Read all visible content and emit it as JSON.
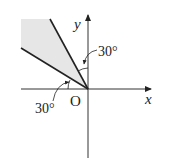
{
  "diagram": {
    "axes": {
      "x_label": "x",
      "y_label": "y",
      "origin_label": "O"
    },
    "angles": [
      {
        "label": "30°",
        "position": "between y-axis and upper ray"
      },
      {
        "label": "30°",
        "position": "between negative x-axis and lower ray"
      }
    ],
    "region": {
      "description": "shaded sector in second quadrant between two rays from origin",
      "fill": "#e6e6e6"
    },
    "colors": {
      "line": "#222222",
      "axis": "#333333",
      "shade": "#e6e6e6"
    }
  }
}
